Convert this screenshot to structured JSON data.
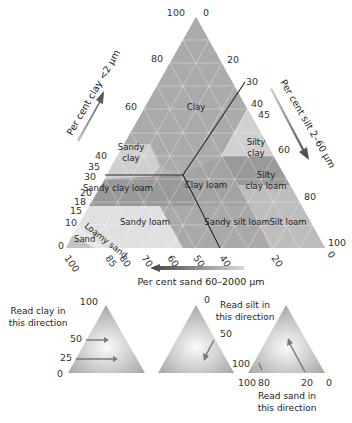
{
  "diagram": {
    "type": "soil texture triangle",
    "axes": {
      "clay": {
        "label": "Per cent clay <2 μm",
        "ticks": [
          "100",
          "80",
          "60",
          "40",
          "35",
          "30",
          "20",
          "18",
          "15",
          "10",
          "0"
        ]
      },
      "silt": {
        "label": "Per cent silt 2–60 μm",
        "ticks": [
          "0",
          "20",
          "30",
          "40",
          "45",
          "60",
          "80",
          "100"
        ]
      },
      "sand": {
        "label": "Per cent sand 60–2000 μm",
        "ticks": [
          "100",
          "85",
          "80",
          "70",
          "60",
          "50",
          "40",
          "20",
          "0"
        ]
      }
    },
    "classes": [
      {
        "name": "Clay"
      },
      {
        "name": "Sandy clay",
        "line1": "Sandy",
        "line2": "clay"
      },
      {
        "name": "Silty clay",
        "line1": "Silty",
        "line2": "clay"
      },
      {
        "name": "Sandy clay loam"
      },
      {
        "name": "Clay loam"
      },
      {
        "name": "Silty clay loam",
        "line1": "Silty",
        "line2": "clay loam"
      },
      {
        "name": "Sandy loam"
      },
      {
        "name": "Sandy silt loam"
      },
      {
        "name": "Silt loam"
      },
      {
        "name": "Loamy sand"
      },
      {
        "name": "Sand"
      }
    ]
  },
  "legend": {
    "clay": {
      "text1": "Read clay in",
      "text2": "this direction",
      "ticks": [
        "100",
        "50",
        "25",
        "0"
      ]
    },
    "silt": {
      "text1": "Read silt in",
      "text2": "this direction",
      "ticks": [
        "0",
        "50",
        "100"
      ]
    },
    "sand": {
      "text1": "Read sand in",
      "text2": "this direction",
      "ticks": [
        "100",
        "80",
        "20",
        "0"
      ]
    }
  }
}
